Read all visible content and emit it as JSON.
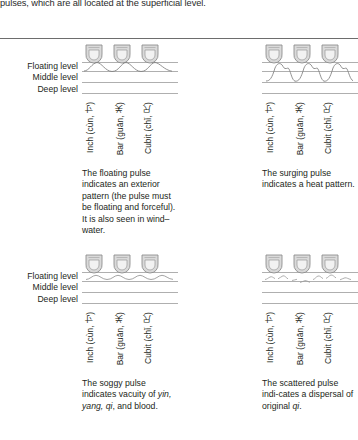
{
  "running_text": "pulses, which are all located at the superficial level.",
  "levels": {
    "floating": "Floating level",
    "middle": "Middle level",
    "deep": "Deep level"
  },
  "position_labels": {
    "inch": "Inch (cùn, 寸)",
    "bar": "Bar (guān, 关)",
    "cubit": "Cubit (chǐ, 尺)"
  },
  "figures": {
    "floating": {
      "name": "floating-pulse",
      "waveform": "floating",
      "caption": "The floating pulse indicates an exterior pattern (the pulse must be floating and forceful). It is also seen in wind–water."
    },
    "surging": {
      "name": "surging-pulse",
      "waveform": "surging",
      "caption": "The surging pulse indicates a heat pattern."
    },
    "soggy": {
      "name": "soggy-pulse",
      "waveform": "soggy",
      "caption_pre": "The soggy pulse indicates vacuity of ",
      "caption_italic": "yin, yang, qi",
      "caption_post": ", and blood."
    },
    "scattered": {
      "name": "scattered-pulse",
      "waveform": "scattered",
      "caption_pre": "The scattered pulse indi-cates a dispersal of original ",
      "caption_italic": "qi",
      "caption_post": "."
    }
  },
  "colors": {
    "text": "#231f20",
    "rule": "#6d6d6d",
    "level_line": "#8a8a8a",
    "finger_outline": "#8e8e8e",
    "finger_fill": "#d6d6d6",
    "pad_fill": "#eeeeee",
    "wave": "#7a7a7a"
  }
}
